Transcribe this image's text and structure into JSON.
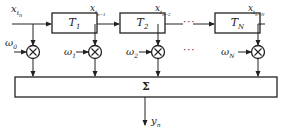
{
  "diagram": {
    "type": "tapped-delay-line filter",
    "input_label": {
      "main": "x",
      "sub": "t",
      "subsub": "n"
    },
    "delay_blocks": [
      {
        "main": "T",
        "sub": "1"
      },
      {
        "main": "T",
        "sub": "2"
      },
      {
        "main": "T",
        "sub": "N"
      }
    ],
    "tap_labels": [
      {
        "main": "x",
        "sub": "t",
        "subsub": "n−1"
      },
      {
        "main": "x",
        "sub": "t",
        "subsub": "n−2"
      },
      {
        "main": "x",
        "sub": "t",
        "subsub": "n−N"
      }
    ],
    "weights": [
      {
        "main": "ω",
        "sub": "0"
      },
      {
        "main": "ω",
        "sub": "1"
      },
      {
        "main": "ω",
        "sub": "2"
      },
      {
        "main": "ω",
        "sub": "N"
      }
    ],
    "ellipsis": "···",
    "multiplier_symbol": "×",
    "summer_symbol": "Σ",
    "output_label": {
      "main": "y",
      "sub": "n"
    }
  }
}
